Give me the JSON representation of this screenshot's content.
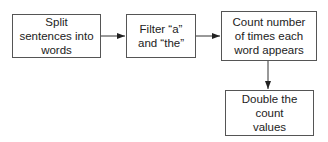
{
  "nodes": [
    {
      "id": "split",
      "label": "Split sentences into words"
    },
    {
      "id": "filter",
      "label": "Filter “a” and “the”"
    },
    {
      "id": "count",
      "label": "Count number of times each word appears"
    },
    {
      "id": "double",
      "label": "Double the count values"
    }
  ],
  "edges": [
    {
      "from": "split",
      "to": "filter"
    },
    {
      "from": "filter",
      "to": "count"
    },
    {
      "from": "count",
      "to": "double"
    }
  ],
  "colors": {
    "stroke": "#555555",
    "text": "#222222",
    "background": "#ffffff"
  }
}
